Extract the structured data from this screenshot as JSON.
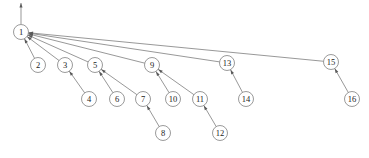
{
  "diagram": {
    "type": "directed-tree",
    "title": "",
    "canvas": {
      "width": 369,
      "height": 158,
      "background": "#ffffff"
    },
    "style": {
      "edge_color": "#6b6b6b",
      "node_stroke": "#6f6f6f",
      "node_fill": "#ffffff",
      "label_color": "#1a1a1a",
      "node_radius": 7.5,
      "edge_width": 0.7
    },
    "root_marker": {
      "name": "root-incoming-arrow",
      "from": {
        "x": 21,
        "y": 3
      },
      "to": {
        "x": 21,
        "y": 24
      },
      "direction": "down-into-root",
      "arrow_at": "top"
    },
    "nodes": [
      {
        "id": "1",
        "label": "1",
        "x": 21,
        "y": 32
      },
      {
        "id": "2",
        "label": "2",
        "x": 38,
        "y": 65
      },
      {
        "id": "3",
        "label": "3",
        "x": 65,
        "y": 65
      },
      {
        "id": "4",
        "label": "4",
        "x": 89,
        "y": 99
      },
      {
        "id": "5",
        "label": "5",
        "x": 95,
        "y": 65
      },
      {
        "id": "6",
        "label": "6",
        "x": 117,
        "y": 99
      },
      {
        "id": "7",
        "label": "7",
        "x": 143,
        "y": 99
      },
      {
        "id": "8",
        "label": "8",
        "x": 163,
        "y": 133
      },
      {
        "id": "9",
        "label": "9",
        "x": 152,
        "y": 65
      },
      {
        "id": "10",
        "label": "10",
        "x": 173,
        "y": 99
      },
      {
        "id": "11",
        "label": "11",
        "x": 200,
        "y": 99
      },
      {
        "id": "12",
        "label": "12",
        "x": 220,
        "y": 133
      },
      {
        "id": "13",
        "label": "13",
        "x": 227,
        "y": 63
      },
      {
        "id": "14",
        "label": "14",
        "x": 246,
        "y": 99
      },
      {
        "id": "15",
        "label": "15",
        "x": 331,
        "y": 62
      },
      {
        "id": "16",
        "label": "16",
        "x": 352,
        "y": 99
      }
    ],
    "edges": [
      {
        "from": "2",
        "to": "1",
        "arrow": true
      },
      {
        "from": "3",
        "to": "1",
        "arrow": true
      },
      {
        "from": "5",
        "to": "1",
        "arrow": true
      },
      {
        "from": "9",
        "to": "1",
        "arrow": true
      },
      {
        "from": "13",
        "to": "1",
        "arrow": true
      },
      {
        "from": "15",
        "to": "1",
        "arrow": true
      },
      {
        "from": "4",
        "to": "3",
        "arrow": true
      },
      {
        "from": "6",
        "to": "5",
        "arrow": true
      },
      {
        "from": "7",
        "to": "5",
        "arrow": true
      },
      {
        "from": "8",
        "to": "7",
        "arrow": true
      },
      {
        "from": "10",
        "to": "9",
        "arrow": true
      },
      {
        "from": "11",
        "to": "9",
        "arrow": true
      },
      {
        "from": "12",
        "to": "11",
        "arrow": true
      },
      {
        "from": "14",
        "to": "13",
        "arrow": true
      },
      {
        "from": "16",
        "to": "15",
        "arrow": true
      }
    ]
  }
}
